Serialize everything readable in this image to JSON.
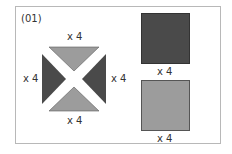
{
  "figure": {
    "id_label": "(01)",
    "colors": {
      "dark": "#4a4a4a",
      "light": "#9c9c9c",
      "frame": "#b8b8b8",
      "background": "#ffffff"
    },
    "triangle_group": {
      "top_count": "x 4",
      "bottom_count": "x 4",
      "left_count": "x 4",
      "right_count": "x 4"
    },
    "squares": [
      {
        "name": "dark-square",
        "count": "x 4"
      },
      {
        "name": "light-square",
        "count": "x 4"
      }
    ]
  }
}
